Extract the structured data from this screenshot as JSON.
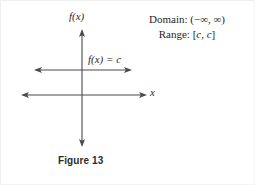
{
  "figure": {
    "caption": "Figure 13",
    "background_color": "#ffffff",
    "stroke_color": "#4a4a4a",
    "text_color": "#1f1f1f"
  },
  "annotations": {
    "domain_label": "Domain:",
    "domain_value": "(−∞, ∞)",
    "domain_full": "Domain: (−∞, ∞)",
    "range_label": "Range:",
    "range_value": "[c, c]",
    "range_full": "Range: [c, c]"
  },
  "labels": {
    "y_axis": "f(x)",
    "x_axis": "x",
    "constant_function": "f(x) = c"
  },
  "chart_data": {
    "type": "line",
    "title": "Figure 13",
    "xlabel": "x",
    "ylabel": "f(x)",
    "grid": false,
    "legend": "none",
    "axes": {
      "x_axis": {
        "pixel_y": 95,
        "pixel_x_start": 22,
        "pixel_x_end": 146,
        "arrows": "both",
        "label": "x"
      },
      "y_axis": {
        "pixel_x": 82,
        "pixel_y_start": 30,
        "pixel_y_end": 146,
        "arrows": "both",
        "label": "f(x)"
      }
    },
    "series": [
      {
        "name": "f(x) = c",
        "equation": "f(x) = c",
        "kind": "constant",
        "arrows": "both",
        "pixel_y": 70,
        "pixel_x_start": 35,
        "pixel_x_end": 131,
        "x": [
          "-∞",
          "∞"
        ],
        "values": [
          "c",
          "c"
        ]
      }
    ],
    "domain": "(−∞, ∞)",
    "range": "[c, c]"
  }
}
